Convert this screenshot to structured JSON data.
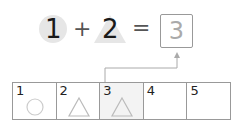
{
  "equation": {
    "left_operand": "1",
    "left_shape": "circle",
    "operator": "+",
    "right_operand": "2",
    "right_shape": "triangle",
    "equals": "=",
    "answer": "3"
  },
  "number_line": {
    "cells": [
      {
        "number": "1",
        "shape": "circle",
        "shaded": false
      },
      {
        "number": "2",
        "shape": "triangle",
        "shaded": false
      },
      {
        "number": "3",
        "shape": "triangle",
        "shaded": true
      },
      {
        "number": "4",
        "shape": "",
        "shaded": false
      },
      {
        "number": "5",
        "shape": "",
        "shaded": false
      }
    ]
  },
  "colors": {
    "shape_bg": "#e6e6e6",
    "line": "#999999",
    "answer_text": "#aaaaaa"
  }
}
